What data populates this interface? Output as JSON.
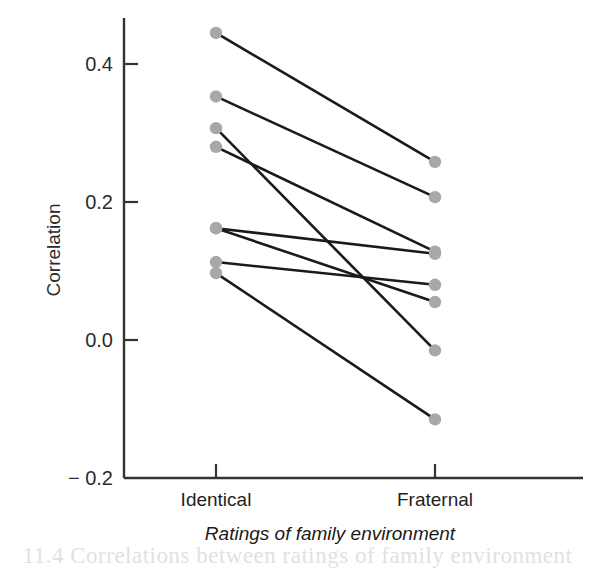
{
  "figure": {
    "background": "#ffffff",
    "line_color": "#1a1a1a",
    "marker_color": "#a8a8a8",
    "axis_color": "#3a3a3a"
  },
  "chart_data": {
    "type": "line",
    "title": "",
    "subtitle": "",
    "xlabel": "Ratings of family environment",
    "ylabel": "Correlation",
    "categories": [
      "Identical",
      "Fraternal"
    ],
    "x_tick_labels": [
      "Identical",
      "Fraternal"
    ],
    "y_tick_labels": [
      "0.4",
      "0.2",
      "0.0",
      "− 0.2"
    ],
    "y_ticks": [
      0.4,
      0.2,
      0.0,
      -0.2
    ],
    "ylim": [
      -0.2,
      0.46
    ],
    "grid": false,
    "legend": "none",
    "marker": "circle",
    "series": [
      {
        "name": "pair-1",
        "values": [
          0.445,
          0.258
        ]
      },
      {
        "name": "pair-2",
        "values": [
          0.353,
          0.207
        ]
      },
      {
        "name": "pair-3",
        "values": [
          0.307,
          -0.015
        ]
      },
      {
        "name": "pair-4",
        "values": [
          0.28,
          0.128
        ]
      },
      {
        "name": "pair-5",
        "values": [
          0.162,
          0.125
        ]
      },
      {
        "name": "pair-6",
        "values": [
          0.162,
          0.055
        ]
      },
      {
        "name": "pair-7",
        "values": [
          0.113,
          0.08
        ]
      },
      {
        "name": "pair-8",
        "values": [
          0.097,
          -0.115
        ]
      }
    ]
  },
  "page_bleed_text": "11.4 Correlations between ratings of family environment"
}
